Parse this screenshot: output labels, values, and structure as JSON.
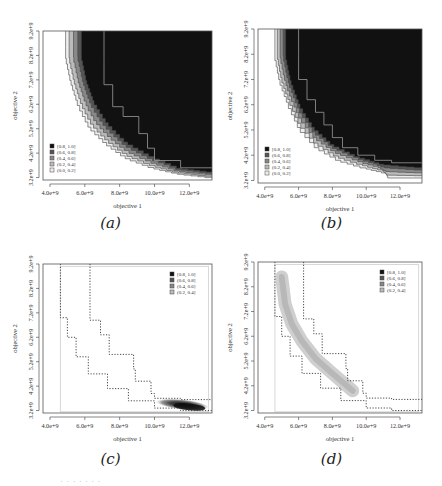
{
  "chart_data": [
    {
      "id": "a",
      "type": "heatmap",
      "caption": "(a)",
      "xlabel": "objective 1",
      "ylabel": "objective 2",
      "xticks": [
        "4.0e+9",
        "6.0e+9",
        "8.0e+9",
        "10.0e+9",
        "12.0e+9"
      ],
      "yticks": [
        "3.2e+9",
        "4.2e+9",
        "5.2e+9",
        "6.2e+9",
        "7.2e+9",
        "8.2e+9",
        "9.2e+9"
      ],
      "xlim": [
        3600000000.0,
        13300000000.0
      ],
      "ylim": [
        3100000000.0,
        9200000000.0
      ],
      "legend": [
        "[0.8, 1.0]",
        "(0.6, 0.8]",
        "(0.4, 0.6]",
        "(0.2, 0.4]",
        "(0.0, 0.2]"
      ],
      "legend_colors": [
        "#111111",
        "#555555",
        "#888888",
        "#bbbbbb",
        "#eeeeee"
      ],
      "legend_position": "bottom-left",
      "description": "Empirical attainment function; region above/right of front dominated with high probability (black), with thin gray bands along curved front from (4.9e9, 9.2e9) to (13.3e9, 3.2e9)",
      "front_outer": [
        [
          4900000000.0,
          9200000000.0
        ],
        [
          4900000000.0,
          8200000000.0
        ],
        [
          5200000000.0,
          7200000000.0
        ],
        [
          5600000000.0,
          6300000000.0
        ],
        [
          6300000000.0,
          5300000000.0
        ],
        [
          7300000000.0,
          4600000000.0
        ],
        [
          8500000000.0,
          4000000000.0
        ],
        [
          10000000000.0,
          3600000000.0
        ],
        [
          11500000000.0,
          3350000000.0
        ],
        [
          13300000000.0,
          3200000000.0
        ]
      ],
      "front_inner": [
        [
          5900000000.0,
          9200000000.0
        ],
        [
          5900000000.0,
          8200000000.0
        ],
        [
          6200000000.0,
          7200000000.0
        ],
        [
          6600000000.0,
          6400000000.0
        ],
        [
          7400000000.0,
          5500000000.0
        ],
        [
          8500000000.0,
          4700000000.0
        ],
        [
          10000000000.0,
          4100000000.0
        ],
        [
          11600000000.0,
          3600000000.0
        ],
        [
          13300000000.0,
          3450000000.0
        ]
      ],
      "median_line": [
        [
          7100000000.0,
          9200000000.0
        ],
        [
          7100000000.0,
          8000000000.0
        ],
        [
          7600000000.0,
          7000000000.0
        ],
        [
          8200000000.0,
          6100000000.0
        ],
        [
          9100000000.0,
          5700000000.0
        ],
        [
          9600000000.0,
          5000000000.0
        ],
        [
          10000000000.0,
          4400000000.0
        ],
        [
          11500000000.0,
          3900000000.0
        ],
        [
          12100000000.0,
          3600000000.0
        ],
        [
          13300000000.0,
          3600000000.0
        ]
      ]
    },
    {
      "id": "b",
      "type": "heatmap",
      "caption": "(b)",
      "xlabel": "objective 1",
      "ylabel": "objective 2",
      "xticks": [
        "4.0e+9",
        "6.0e+9",
        "8.0e+9",
        "10.0e+9",
        "12.0e+9"
      ],
      "yticks": [
        "3.2e+9",
        "4.2e+9",
        "5.2e+9",
        "6.2e+9",
        "7.2e+9",
        "8.2e+9",
        "9.2e+9"
      ],
      "xlim": [
        3600000000.0,
        13300000000.0
      ],
      "ylim": [
        3100000000.0,
        9200000000.0
      ],
      "legend": [
        "[0.8, 1.0]",
        "(0.6, 0.8]",
        "(0.4, 0.6]",
        "(0.2, 0.4]",
        "(0.0, 0.2]"
      ],
      "legend_colors": [
        "#111111",
        "#555555",
        "#888888",
        "#bbbbbb",
        "#eeeeee"
      ],
      "legend_position": "bottom-left",
      "description": "Empirical attainment function, similar to (a) with tighter front",
      "front_outer": [
        [
          4600000000.0,
          9200000000.0
        ],
        [
          4600000000.0,
          8200000000.0
        ],
        [
          4900000000.0,
          7200000000.0
        ],
        [
          5400000000.0,
          6300000000.0
        ],
        [
          6100000000.0,
          5300000000.0
        ],
        [
          7200000000.0,
          4500000000.0
        ],
        [
          8500000000.0,
          4000000000.0
        ],
        [
          10000000000.0,
          3700000000.0
        ],
        [
          11200000000.0,
          3500000000.0
        ],
        [
          11300000000.0,
          3300000000.0
        ],
        [
          13300000000.0,
          3300000000.0
        ]
      ],
      "front_inner": [
        [
          5300000000.0,
          9200000000.0
        ],
        [
          5300000000.0,
          8200000000.0
        ],
        [
          5600000000.0,
          7200000000.0
        ],
        [
          6100000000.0,
          6300000000.0
        ],
        [
          6900000000.0,
          5400000000.0
        ],
        [
          8000000000.0,
          4700000000.0
        ],
        [
          9500000000.0,
          4200000000.0
        ],
        [
          11000000000.0,
          3900000000.0
        ],
        [
          13300000000.0,
          3750000000.0
        ]
      ],
      "median_line": [
        [
          6000000000.0,
          9200000000.0
        ],
        [
          6000000000.0,
          8200000000.0
        ],
        [
          6500000000.0,
          7200000000.0
        ],
        [
          7000000000.0,
          6400000000.0
        ],
        [
          7500000000.0,
          5900000000.0
        ],
        [
          8000000000.0,
          5400000000.0
        ],
        [
          8600000000.0,
          4900000000.0
        ],
        [
          9500000000.0,
          4500000000.0
        ],
        [
          10500000000.0,
          4200000000.0
        ],
        [
          11500000000.0,
          4000000000.0
        ],
        [
          13300000000.0,
          3900000000.0
        ]
      ]
    },
    {
      "id": "c",
      "type": "heatmap",
      "caption": "(c)",
      "xlabel": "objective 1",
      "ylabel": "objective 2",
      "xticks": [
        "4.0e+9",
        "6.0e+9",
        "8.0e+9",
        "10.0e+9",
        "12.0e+9"
      ],
      "yticks": [
        "3.2e+9",
        "4.2e+9",
        "5.2e+9",
        "6.2e+9",
        "7.2e+9",
        "8.2e+9",
        "9.2e+9"
      ],
      "xlim": [
        3600000000.0,
        13300000000.0
      ],
      "ylim": [
        3100000000.0,
        9200000000.0
      ],
      "legend": [
        "[0.8, 1.0]",
        "(0.6, 0.8]",
        "(0.4, 0.6]",
        "(0.2, 0.4]"
      ],
      "legend_colors": [
        "#111111",
        "#555555",
        "#888888",
        "#bbbbbb"
      ],
      "legend_position": "top-right",
      "description": "Difference in attainment; dotted outer/inner attainment bounds; dense dark blob near (12e9, 3.4e9)",
      "dotted_lower": [
        [
          4600000000.0,
          9200000000.0
        ],
        [
          4600000000.0,
          7900000000.0
        ],
        [
          5000000000.0,
          7000000000.0
        ],
        [
          5500000000.0,
          6200000000.0
        ],
        [
          6200000000.0,
          5400000000.0
        ],
        [
          7300000000.0,
          4700000000.0
        ],
        [
          8500000000.0,
          4100000000.0
        ],
        [
          10000000000.0,
          3600000000.0
        ],
        [
          11500000000.0,
          3300000000.0
        ],
        [
          13300000000.0,
          3200000000.0
        ]
      ],
      "dotted_upper": [
        [
          6300000000.0,
          9200000000.0
        ],
        [
          6300000000.0,
          7800000000.0
        ],
        [
          6900000000.0,
          6900000000.0
        ],
        [
          7400000000.0,
          6300000000.0
        ],
        [
          7900000000.0,
          5500000000.0
        ],
        [
          8800000000.0,
          5500000000.0
        ],
        [
          8900000000.0,
          4900000000.0
        ],
        [
          9800000000.0,
          4400000000.0
        ],
        [
          10000000000.0,
          3900000000.0
        ],
        [
          11500000000.0,
          3700000000.0
        ],
        [
          13300000000.0,
          3650000000.0
        ]
      ],
      "blob": {
        "cx": 11600000000.0,
        "cy": 3450000000.0,
        "rx": 1600000000.0,
        "ry": 220000000.0,
        "dense_cx": 12000000000.0,
        "dense_cy": 3350000000.0
      }
    },
    {
      "id": "d",
      "type": "heatmap",
      "caption": "(d)",
      "xlabel": "objective 1",
      "ylabel": "objective 2",
      "xticks": [
        "4.0e+9",
        "6.0e+9",
        "8.0e+9",
        "10.0e+9",
        "12.0e+9"
      ],
      "yticks": [
        "3.2e+9",
        "4.2e+9",
        "5.2e+9",
        "6.2e+9",
        "7.2e+9",
        "8.2e+9",
        "9.2e+9"
      ],
      "xlim": [
        3600000000.0,
        13300000000.0
      ],
      "ylim": [
        3100000000.0,
        9200000000.0
      ],
      "legend": [
        "[0.8, 1.0]",
        "(0.6, 0.8]",
        "(0.4, 0.6]",
        "(0.2, 0.4]"
      ],
      "legend_colors": [
        "#111111",
        "#555555",
        "#888888",
        "#bbbbbb"
      ],
      "legend_position": "top-right",
      "description": "Difference in attainment; light gray crescent band along front from (5.0e9, 8.6e9) to (9.2e9, 4.0e9)",
      "dotted_lower": [
        [
          4600000000.0,
          9200000000.0
        ],
        [
          4600000000.0,
          7600000000.0
        ],
        [
          5000000000.0,
          7000000000.0
        ],
        [
          5500000000.0,
          6200000000.0
        ],
        [
          6200000000.0,
          5400000000.0
        ],
        [
          7300000000.0,
          4700000000.0
        ],
        [
          8500000000.0,
          4100000000.0
        ],
        [
          10000000000.0,
          3600000000.0
        ],
        [
          11500000000.0,
          3300000000.0
        ],
        [
          13300000000.0,
          3200000000.0
        ]
      ],
      "dotted_upper": [
        [
          6300000000.0,
          9200000000.0
        ],
        [
          6300000000.0,
          7800000000.0
        ],
        [
          6900000000.0,
          6900000000.0
        ],
        [
          7400000000.0,
          6300000000.0
        ],
        [
          7900000000.0,
          5500000000.0
        ],
        [
          8800000000.0,
          5500000000.0
        ],
        [
          8900000000.0,
          4900000000.0
        ],
        [
          9800000000.0,
          4400000000.0
        ],
        [
          10000000000.0,
          3900000000.0
        ],
        [
          11500000000.0,
          3700000000.0
        ],
        [
          13300000000.0,
          3650000000.0
        ]
      ],
      "band": [
        [
          5000000000.0,
          8600000000.0
        ],
        [
          5200000000.0,
          7500000000.0
        ],
        [
          5600000000.0,
          6700000000.0
        ],
        [
          6200000000.0,
          6000000000.0
        ],
        [
          7000000000.0,
          5300000000.0
        ],
        [
          8000000000.0,
          4700000000.0
        ],
        [
          9200000000.0,
          4000000000.0
        ]
      ]
    }
  ],
  "footer_text": "· · ·  ·  · ·  ·"
}
